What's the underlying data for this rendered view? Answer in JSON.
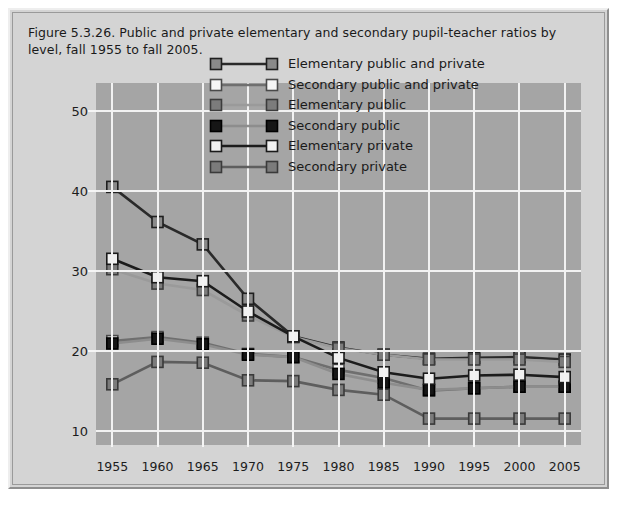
{
  "figure": {
    "title": "Figure 5.3.26. Public and private elementary and secondary pupil-teacher ratios by level, fall 1955 to fall 2005.",
    "background_color": "#d4d4d4",
    "plot_background_color": "#a5a5a5",
    "grid_color": "#f2f2f2"
  },
  "chart_data": {
    "type": "line",
    "title": "Figure 5.3.26. Public and private elementary and secondary pupil-teacher ratios by level, fall 1955 to fall 2005.",
    "xlabel": "",
    "ylabel": "",
    "x": [
      1955,
      1960,
      1965,
      1970,
      1975,
      1980,
      1985,
      1990,
      1995,
      2000,
      2005
    ],
    "xtick_labels": [
      "1955",
      "1960",
      "1965",
      "1970",
      "1975",
      "1980",
      "1985",
      "1990",
      "1995",
      "2000",
      "2005"
    ],
    "ytick_labels": [
      "10",
      "20",
      "30",
      "40",
      "50"
    ],
    "yticks": [
      10,
      20,
      30,
      40,
      50
    ],
    "ylim": [
      8.2,
      53.5
    ],
    "xlim": [
      1953.2,
      2006.8
    ],
    "grid": true,
    "legend_position": "upper center",
    "marker": "square",
    "series": [
      {
        "name": "Elementary public and private",
        "color": "#2a2a2a",
        "marker_fill": "#8a8a8a",
        "marker_edge": "#1f1f1f",
        "values": [
          40.5,
          36.1,
          33.3,
          26.5,
          21.8,
          20.4,
          19.5,
          19.0,
          19.1,
          19.2,
          18.9
        ]
      },
      {
        "name": "Secondary public and private",
        "color": "#6f6f6f",
        "marker_fill": "#f5f5f5",
        "marker_edge": "#4a4a4a",
        "values": [
          21.2,
          21.7,
          21.0,
          19.6,
          19.2,
          17.6,
          16.6,
          15.0,
          15.3,
          15.5,
          15.5
        ]
      },
      {
        "name": "Elementary public",
        "color": "#9a9a9a",
        "marker_fill": "#7c7c7c",
        "marker_edge": "#3c3c3c",
        "values": [
          30.2,
          28.4,
          27.6,
          24.4,
          21.7,
          20.3,
          19.5,
          18.9,
          18.9,
          18.9,
          18.6
        ]
      },
      {
        "name": "Secondary public",
        "color": "#8d8d8d",
        "marker_fill": "#161616",
        "marker_edge": "#000000",
        "values": [
          20.9,
          21.5,
          20.8,
          19.5,
          19.2,
          17.1,
          16.0,
          15.1,
          15.3,
          15.5,
          15.5
        ]
      },
      {
        "name": "Elementary private",
        "color": "#1c1c1c",
        "marker_fill": "#f0f0f0",
        "marker_edge": "#1a1a1a",
        "values": [
          31.5,
          29.2,
          28.7,
          24.9,
          21.8,
          19.1,
          17.3,
          16.5,
          16.9,
          17.0,
          16.7
        ]
      },
      {
        "name": "Secondary private",
        "color": "#5e5e5e",
        "marker_fill": "#7b7b7b",
        "marker_edge": "#3a3a3a",
        "values": [
          15.8,
          18.6,
          18.5,
          16.3,
          16.2,
          15.1,
          14.5,
          11.5,
          11.5,
          11.5,
          11.5
        ]
      }
    ]
  }
}
